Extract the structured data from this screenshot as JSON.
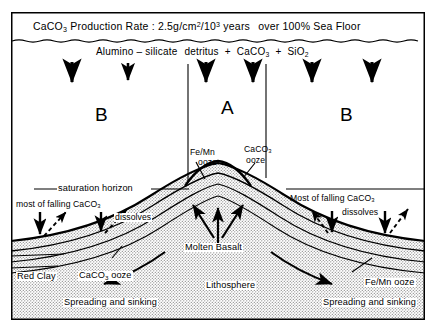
{
  "figure": {
    "type": "cross-section-diagram"
  },
  "banner": {
    "compound": "CaCO",
    "compound_sub": "3",
    "text_1": "Production Rate : 2.5g/cm",
    "sup_1": "2",
    "text_2": "/10",
    "sup_2": "3",
    "text_3": "years",
    "text_4": "over 100% Sea Floor",
    "full_text": "CaCO3 Production Rate : 2.5g/cm2/103 years over 100% Sea Floor"
  },
  "inputs": {
    "label_1": "Alumino",
    "dash": "–",
    "label_2": "silicate",
    "label_3": "detritus",
    "plus_1": "+",
    "label_4": "CaCO",
    "label_4_sub": "3",
    "plus_2": "+",
    "label_5": "SiO",
    "label_5_sub": "2",
    "full_text": "Alumino - silicate detritus + CaCO3 + SiO2"
  },
  "zones": {
    "left": "B",
    "center": "A",
    "right": "B"
  },
  "ooze_labels": {
    "crest_left_line1": "Fe/Mn",
    "crest_left_line2": "ooze",
    "crest_right_line1": "CaCO",
    "crest_right_line1_sub": "3",
    "crest_right_line2": "ooze",
    "flank_left_red_clay": "Red Clay",
    "flank_left_ooze": "CaCO",
    "flank_left_ooze_sub": "3",
    "flank_left_ooze_tail": "ooze",
    "flank_right_ooze": "Fe/Mn ooze"
  },
  "horizon": {
    "label": "saturation horizon"
  },
  "dissolution": {
    "left_line1": "most of falling CaCO",
    "left_line1_sub": "3",
    "left_line2": "dissolves",
    "right_line1": "Most of falling CaCO",
    "right_line1_sub": "3",
    "right_line2": "dissolves"
  },
  "interior": {
    "molten_basalt": "Molten Basalt",
    "lithosphere": "Lithosphere"
  },
  "spreading": {
    "left": "Spreading and sinking",
    "right": "Spreading and sinking"
  },
  "colors": {
    "ink": "#000000",
    "paper": "#ffffff",
    "basement_fill": "#d8d8d8",
    "frame": "#000000"
  }
}
